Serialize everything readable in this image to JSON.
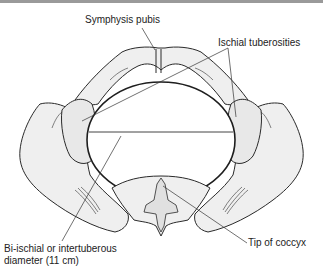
{
  "diagram": {
    "labels": {
      "symphysis_pubis": "Symphysis pubis",
      "ischial_tuberosities": "Ischial tuberosities",
      "tip_of_coccyx": "Tip of coccyx",
      "diameter_line1": "Bi-ischial or intertuberous",
      "diameter_line2": "diameter (11 cm)"
    },
    "colors": {
      "bone_fill": "#efefef",
      "outline": "#2a2a2a",
      "label_text": "#222222",
      "top_bar": "#9a9a9a"
    }
  }
}
